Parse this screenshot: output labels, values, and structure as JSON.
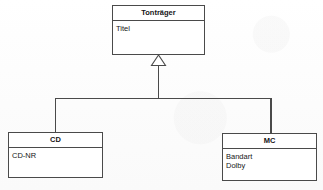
{
  "diagram": {
    "kind": "uml-class-diagram",
    "notation": "UML generalization (inheritance)",
    "background_color": "#fdfdfd",
    "line_color": "#4a4a4a",
    "text_color": "#161616",
    "superclass": {
      "name": "Tonträger",
      "attributes": [
        "Titel"
      ]
    },
    "subclasses": [
      {
        "name": "CD",
        "attributes": [
          "CD-NR"
        ]
      },
      {
        "name": "MC",
        "attributes": [
          "Bandart",
          "Dolby"
        ]
      }
    ],
    "relationship": {
      "type": "generalization",
      "arrowhead": "hollow-triangle",
      "arrowhead_target": "Tonträger",
      "sources": [
        "CD",
        "MC"
      ]
    }
  }
}
